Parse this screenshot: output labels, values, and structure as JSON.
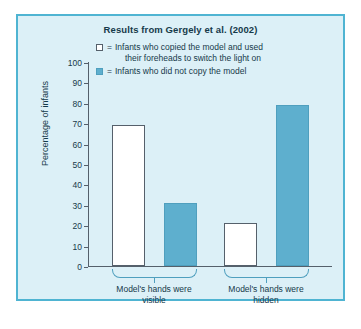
{
  "figure": {
    "title": "Results from Gergely et al. (2002)",
    "panel_color": "#dcf0f7",
    "border_color": "#4fb4d2"
  },
  "legend": {
    "equals": "=",
    "items": [
      {
        "swatch": "white-square",
        "color": "#ffffff",
        "label_line1": "Infants who copied the model and used",
        "label_line2": "their foreheads to switch the light on"
      },
      {
        "swatch": "blue-square",
        "color": "#5eafce",
        "label_line1": "Infants who did not copy the model",
        "label_line2": ""
      }
    ]
  },
  "chart_data": {
    "type": "bar",
    "title": "Results from Gergely et al. (2002)",
    "xlabel": "",
    "ylabel": "Percentage of infants",
    "ylim": [
      0,
      100
    ],
    "ytick_step": 10,
    "yticks": [
      0,
      10,
      20,
      30,
      40,
      50,
      60,
      70,
      80,
      90,
      100
    ],
    "grid": false,
    "legend_position": "top",
    "categories": [
      "Model's hands were visible",
      "Model's hands were hidden"
    ],
    "category_lines": [
      [
        "Model's hands were",
        "visible"
      ],
      [
        "Model's hands were",
        "hidden"
      ]
    ],
    "series": [
      {
        "name": "Infants who copied the model and used their foreheads to switch the light on",
        "color": "#ffffff",
        "values": [
          69,
          21
        ]
      },
      {
        "name": "Infants who did not copy the model",
        "color": "#5eafce",
        "values": [
          31,
          79
        ]
      }
    ]
  }
}
